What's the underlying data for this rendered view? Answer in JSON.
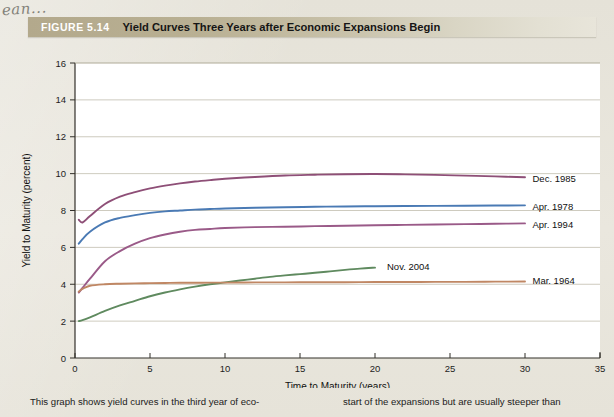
{
  "annotation": {
    "handwritten_note": "ean..."
  },
  "figure": {
    "number_label": "FIGURE 5.14",
    "title": "Yield Curves Three Years after Economic Expansions Begin"
  },
  "caption": {
    "left_column": "This graph shows yield curves in the third year of eco-",
    "right_column": "start of the expansions but are usually steeper than"
  },
  "chart_data": {
    "type": "line",
    "title": "Yield Curves Three Years after Economic Expansions Begin",
    "xlabel": "Time to Maturity (years)",
    "ylabel": "Yield to Maturity (percent)",
    "xlim": [
      0,
      35
    ],
    "ylim": [
      0,
      16
    ],
    "xticks": [
      0,
      5,
      10,
      15,
      20,
      25,
      30,
      35
    ],
    "yticks": [
      0,
      2,
      4,
      6,
      8,
      10,
      12,
      14,
      16
    ],
    "grid": "horizontal",
    "legend_position": "inline-right-of-curve",
    "plot_background": "#ffffff",
    "series": [
      {
        "name": "Dec. 1985",
        "color": "#8e4f77",
        "label_x": 30.3,
        "label_y": 9.75,
        "x": [
          0.25,
          0.5,
          1,
          2,
          3,
          4,
          5,
          6,
          7,
          8,
          9,
          10,
          12,
          14,
          16,
          18,
          20,
          22,
          24,
          26,
          28,
          30
        ],
        "y": [
          7.5,
          7.35,
          7.7,
          8.35,
          8.75,
          9.0,
          9.2,
          9.35,
          9.47,
          9.57,
          9.65,
          9.72,
          9.82,
          9.9,
          9.94,
          9.97,
          9.98,
          9.96,
          9.93,
          9.89,
          9.85,
          9.8
        ]
      },
      {
        "name": "Apr. 1978",
        "color": "#4a7ab4",
        "label_x": 30.3,
        "label_y": 8.2,
        "x": [
          0.25,
          0.5,
          1,
          2,
          3,
          4,
          5,
          6,
          7,
          8,
          9,
          10,
          12,
          14,
          16,
          18,
          20,
          22,
          24,
          26,
          28,
          30
        ],
        "y": [
          6.2,
          6.45,
          6.85,
          7.35,
          7.6,
          7.75,
          7.87,
          7.95,
          8.0,
          8.05,
          8.08,
          8.11,
          8.15,
          8.18,
          8.2,
          8.22,
          8.23,
          8.24,
          8.25,
          8.26,
          8.27,
          8.28
        ]
      },
      {
        "name": "Apr. 1994",
        "color": "#9a5a88",
        "label_x": 30.3,
        "label_y": 7.25,
        "x": [
          0.25,
          0.5,
          1,
          2,
          3,
          4,
          5,
          6,
          7,
          8,
          9,
          10,
          12,
          14,
          16,
          18,
          20,
          22,
          24,
          26,
          28,
          30
        ],
        "y": [
          3.55,
          3.8,
          4.3,
          5.25,
          5.8,
          6.2,
          6.5,
          6.7,
          6.85,
          6.95,
          7.0,
          7.05,
          7.1,
          7.12,
          7.15,
          7.17,
          7.2,
          7.22,
          7.24,
          7.26,
          7.28,
          7.3
        ]
      },
      {
        "name": "Nov. 2004",
        "color": "#5f8a5f",
        "label_x": 20.6,
        "label_y": 4.95,
        "x": [
          0.25,
          0.5,
          1,
          2,
          3,
          4,
          5,
          6,
          7,
          8,
          9,
          10,
          11,
          12,
          13,
          14,
          15,
          16,
          17,
          18,
          19,
          20
        ],
        "y": [
          2.0,
          2.05,
          2.2,
          2.55,
          2.85,
          3.1,
          3.35,
          3.55,
          3.72,
          3.87,
          4.0,
          4.1,
          4.2,
          4.3,
          4.4,
          4.48,
          4.55,
          4.62,
          4.7,
          4.78,
          4.85,
          4.9
        ]
      },
      {
        "name": "Mar. 1964",
        "color": "#c08764",
        "label_x": 30.3,
        "label_y": 4.2,
        "x": [
          0.25,
          0.5,
          1,
          2,
          3,
          4,
          5,
          6,
          7,
          8,
          9,
          10,
          12,
          14,
          16,
          18,
          20,
          22,
          24,
          26,
          28,
          30
        ],
        "y": [
          3.6,
          3.75,
          3.92,
          4.0,
          4.03,
          4.05,
          4.06,
          4.07,
          4.08,
          4.08,
          4.09,
          4.09,
          4.1,
          4.1,
          4.11,
          4.11,
          4.12,
          4.12,
          4.13,
          4.13,
          4.14,
          4.15
        ]
      }
    ]
  }
}
